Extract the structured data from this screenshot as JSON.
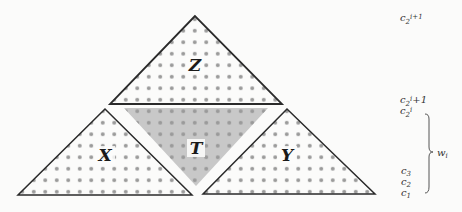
{
  "diagram": {
    "triangles": [
      {
        "id": "Z",
        "label": "Z",
        "orientation": "up",
        "shaded": false
      },
      {
        "id": "X",
        "label": "X",
        "orientation": "up",
        "shaded": false
      },
      {
        "id": "Y",
        "label": "Y",
        "orientation": "up",
        "shaded": false
      },
      {
        "id": "T",
        "label": "T",
        "orientation": "down",
        "shaded": true
      }
    ],
    "colors": {
      "outline": "#2a2a2a",
      "dot": "#9a9a9a",
      "shade": "#c8c8c8",
      "background": "#fbfbfa"
    },
    "side_labels": {
      "top": {
        "base": "c",
        "sub": "2",
        "sup": "i+1"
      },
      "upper": {
        "base": "c",
        "sub": "2",
        "sup": "i",
        "tail": "+1"
      },
      "upper2": {
        "base": "c",
        "sub": "2",
        "sup": "i"
      },
      "c3": {
        "base": "c",
        "sub": "3"
      },
      "c2": {
        "base": "c",
        "sub": "2"
      },
      "c1": {
        "base": "c",
        "sub": "1"
      },
      "brace_label": {
        "base": "w",
        "sub": "i"
      }
    }
  }
}
